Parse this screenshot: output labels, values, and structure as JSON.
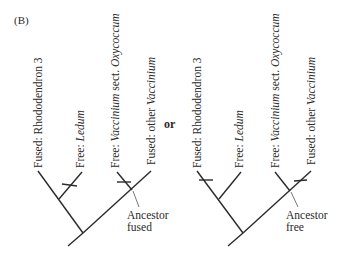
{
  "panel_label": "(B)",
  "connector": "or",
  "trees": [
    {
      "id": "left",
      "tips": [
        {
          "prefix": "Fused: ",
          "name": "Rhododendron 3",
          "name_italic": false
        },
        {
          "prefix": "Free: ",
          "name": "Ledum",
          "name_italic": true
        },
        {
          "prefix": "Free: ",
          "name": "Vaccinium",
          "name_italic": true,
          "suffix": " sect. ",
          "suffix2": "Oxycoccum"
        },
        {
          "prefix": "Fused: other ",
          "name": "Vaccinium",
          "name_italic": true
        }
      ],
      "ancestor_note": {
        "line1": "Ancestor",
        "line2": "fused"
      },
      "transition_marks_on": [
        "Ledum",
        "Vaccinium sect. Oxycoccum"
      ]
    },
    {
      "id": "right",
      "tips": [
        {
          "prefix": "Fused: ",
          "name": "Rhododendron 3",
          "name_italic": false
        },
        {
          "prefix": "Free: ",
          "name": "Ledum",
          "name_italic": true
        },
        {
          "prefix": "Free: ",
          "name": "Vaccinium",
          "name_italic": true,
          "suffix": " sect. ",
          "suffix2": "Oxycoccum"
        },
        {
          "prefix": "Fused: other ",
          "name": "Vaccinium",
          "name_italic": true
        }
      ],
      "ancestor_note": {
        "line1": "Ancestor",
        "line2": "free"
      },
      "transition_marks_on": [
        "Rhododendron 3",
        "other Vaccinium"
      ]
    }
  ]
}
